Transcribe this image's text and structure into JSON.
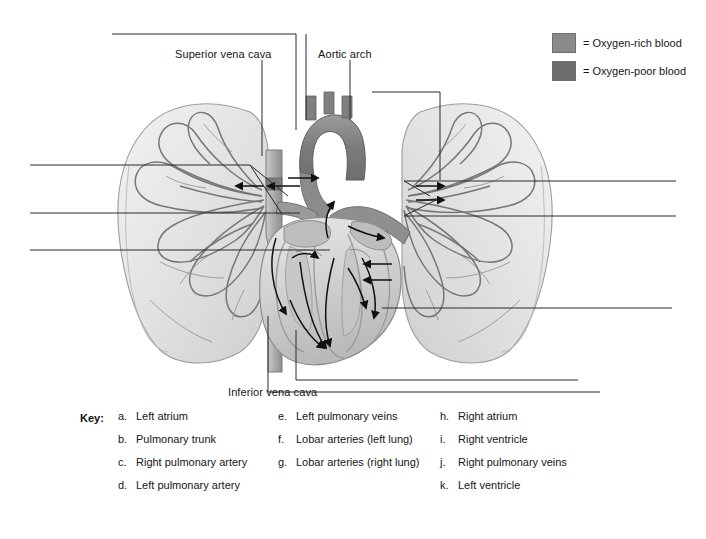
{
  "figure": {
    "background": "#ffffff"
  },
  "legend": {
    "items": [
      {
        "label": "= Oxygen-rich blood",
        "swatch_name": "oxygen-rich-swatch",
        "color": "#8a8a8a"
      },
      {
        "label": "= Oxygen-poor blood",
        "swatch_name": "oxygen-poor-swatch",
        "color": "#6e6e6e"
      }
    ]
  },
  "callouts": [
    {
      "id": "superior-vena-cava",
      "label": "Superior vena cava"
    },
    {
      "id": "aortic-arch",
      "label": "Aortic arch"
    },
    {
      "id": "inferior-vena-cava",
      "label": "Inferior vena cava"
    }
  ],
  "key": {
    "title": "Key:",
    "columns": [
      {
        "name": "key-column-1",
        "entries": [
          {
            "letter": "a.",
            "text": "Left atrium"
          },
          {
            "letter": "b.",
            "text": "Pulmonary trunk"
          },
          {
            "letter": "c.",
            "text": "Right pulmonary artery"
          },
          {
            "letter": "d.",
            "text": "Left pulmonary artery"
          }
        ]
      },
      {
        "name": "key-column-2",
        "entries": [
          {
            "letter": "e.",
            "text": "Left pulmonary veins"
          },
          {
            "letter": "f.",
            "text": "Lobar arteries (left lung)"
          },
          {
            "letter": "g.",
            "text": "Lobar arteries (right lung)"
          }
        ]
      },
      {
        "name": "key-column-3",
        "entries": [
          {
            "letter": "h.",
            "text": "Right atrium"
          },
          {
            "letter": "i.",
            "text": "Right ventricle"
          },
          {
            "letter": "j.",
            "text": "Right pulmonary veins"
          },
          {
            "letter": "k.",
            "text": "Left ventricle"
          }
        ]
      }
    ]
  },
  "anatomy": {
    "structures": [
      "left lung",
      "right lung",
      "heart",
      "aortic arch",
      "pulmonary trunk",
      "superior vena cava",
      "inferior vena cava"
    ],
    "flow_arrows_visible": true,
    "palette": {
      "lung_fill": "#e9e9e9",
      "lung_edge": "#9a9a9a",
      "vessel_line": "#6a6a6a",
      "heart_dark": "#7d7d7d",
      "heart_mid": "#a8a8a8",
      "heart_light": "#d5d5d5",
      "leader_line": "#2b2b2b"
    }
  }
}
